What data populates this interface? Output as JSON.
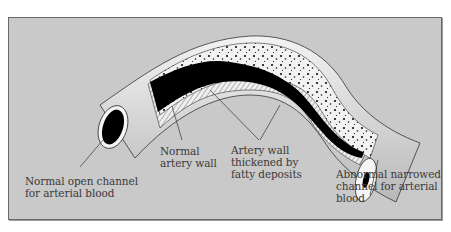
{
  "diagram": {
    "colors": {
      "background": "#c9c9c9",
      "artery_outer": "#e6e6e6",
      "blood_channel": "#000000",
      "fatty_deposit": "#f2f2f2",
      "text": "#3a3a3a"
    },
    "labels": [
      {
        "id": "normal-open-channel",
        "text": "Normal open channel\nfor arterial blood"
      },
      {
        "id": "normal-artery-wall",
        "text": "Normal\nartery wall"
      },
      {
        "id": "thickened-wall",
        "text": "Artery wall\nthickened by\nfatty deposits"
      },
      {
        "id": "narrowed-channel",
        "text": "Abnormal narrowed\nchannel for arterial\nblood"
      }
    ]
  }
}
